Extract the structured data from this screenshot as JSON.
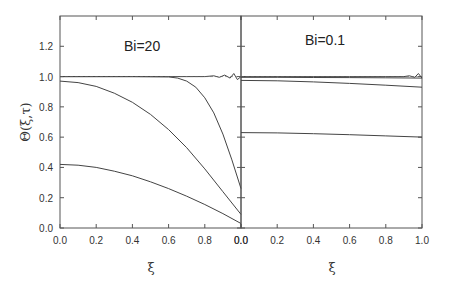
{
  "chart_data": {
    "type": "line",
    "ylabel": "Θ(ξ,τ)",
    "ylim": [
      0,
      1.4
    ],
    "yticks": [
      "0.0",
      "0.2",
      "0.4",
      "0.6",
      "0.8",
      "1.0",
      "1.2"
    ],
    "ytick_values": [
      0,
      0.2,
      0.4,
      0.6,
      0.8,
      1.0,
      1.2
    ],
    "panels": [
      {
        "title": "Bi=20",
        "xlabel": "ξ",
        "xlim": [
          0,
          1
        ],
        "xticks": [
          "0.0",
          "0.2",
          "0.4",
          "0.6",
          "0.8",
          "0.0"
        ],
        "xtick_values": [
          0,
          0.2,
          0.4,
          0.6,
          0.8,
          1.0
        ],
        "series": [
          {
            "name": "curve-1",
            "x": [
              0,
              0.1,
              0.2,
              0.3,
              0.4,
              0.5,
              0.6,
              0.7,
              0.8,
              0.85,
              0.88,
              0.91,
              0.94,
              0.96,
              0.98,
              1.0
            ],
            "y": [
              1.0,
              1.0,
              1.0,
              1.0,
              1.0,
              1.0,
              1.0,
              1.0,
              1.0,
              1.005,
              0.995,
              1.01,
              0.99,
              1.02,
              0.98,
              1.0
            ]
          },
          {
            "name": "curve-2",
            "x": [
              0,
              0.2,
              0.4,
              0.6,
              0.65,
              0.7,
              0.75,
              0.8,
              0.85,
              0.9,
              0.95,
              1.0
            ],
            "y": [
              1.0,
              1.0,
              1.0,
              0.998,
              0.99,
              0.97,
              0.93,
              0.86,
              0.76,
              0.62,
              0.45,
              0.26
            ]
          },
          {
            "name": "curve-3",
            "x": [
              0,
              0.1,
              0.2,
              0.3,
              0.4,
              0.5,
              0.6,
              0.7,
              0.8,
              0.9,
              1.0
            ],
            "y": [
              0.97,
              0.96,
              0.935,
              0.89,
              0.83,
              0.75,
              0.65,
              0.53,
              0.39,
              0.24,
              0.09
            ]
          },
          {
            "name": "curve-4",
            "x": [
              0,
              0.1,
              0.2,
              0.3,
              0.4,
              0.5,
              0.6,
              0.7,
              0.8,
              0.9,
              1.0
            ],
            "y": [
              0.42,
              0.415,
              0.4,
              0.375,
              0.345,
              0.305,
              0.26,
              0.21,
              0.155,
              0.095,
              0.03
            ]
          }
        ]
      },
      {
        "title": "Bi=0.1",
        "xlabel": "ξ",
        "xlim": [
          0,
          1
        ],
        "xticks": [
          "0.0",
          "0.2",
          "0.4",
          "0.6",
          "0.8",
          "1.0"
        ],
        "xtick_values": [
          0,
          0.2,
          0.4,
          0.6,
          0.8,
          1.0
        ],
        "series": [
          {
            "name": "curve-1",
            "x": [
              0,
              0.2,
              0.4,
              0.6,
              0.8,
              0.9,
              0.93,
              0.96,
              0.98,
              1.0
            ],
            "y": [
              1.0,
              1.0,
              1.0,
              1.0,
              1.0,
              1.0,
              1.005,
              0.995,
              1.02,
              0.99
            ]
          },
          {
            "name": "curve-2",
            "x": [
              0,
              0.2,
              0.4,
              0.6,
              0.8,
              1.0
            ],
            "y": [
              0.995,
              0.995,
              0.994,
              0.993,
              0.992,
              0.99
            ]
          },
          {
            "name": "curve-3",
            "x": [
              0,
              0.2,
              0.4,
              0.6,
              0.8,
              1.0
            ],
            "y": [
              0.975,
              0.972,
              0.965,
              0.955,
              0.943,
              0.93
            ]
          },
          {
            "name": "curve-4",
            "x": [
              0,
              0.2,
              0.4,
              0.6,
              0.8,
              1.0
            ],
            "y": [
              0.63,
              0.628,
              0.623,
              0.616,
              0.608,
              0.6
            ]
          }
        ]
      }
    ]
  }
}
